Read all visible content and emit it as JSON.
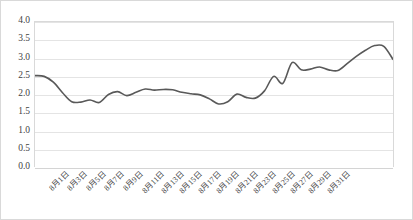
{
  "chart_data": {
    "type": "line",
    "title": "",
    "subtitle": "",
    "xlabel": "",
    "ylabel": "",
    "ylim": [
      0.0,
      4.0
    ],
    "y_ticks": [
      "0.0",
      "0.5",
      "1.0",
      "1.5",
      "2.0",
      "2.5",
      "3.0",
      "3.5",
      "4.0"
    ],
    "y_tick_values": [
      0.0,
      0.5,
      1.0,
      1.5,
      2.0,
      2.5,
      3.0,
      3.5,
      4.0
    ],
    "grid": true,
    "legend": false,
    "legend_position": "none",
    "line_color": "#595959",
    "line_width": 1.6,
    "x_tick_labels": [
      "8月1日",
      "8月3日",
      "8月5日",
      "8月7日",
      "8月9日",
      "8月11日",
      "8月13日",
      "8月15日",
      "8月17日",
      "8月19日",
      "8月21日",
      "8月23日",
      "8月25日",
      "8月27日",
      "8月29日",
      "8月31日"
    ],
    "x": [
      "8月1日",
      "8月2日",
      "8月3日",
      "8月4日",
      "8月5日",
      "8月6日",
      "8月7日",
      "8月8日",
      "8月9日",
      "8月10日",
      "8月11日",
      "8月12日",
      "8月13日",
      "8月14日",
      "8月15日",
      "8月16日",
      "8月17日",
      "8月18日",
      "8月19日",
      "8月20日",
      "8月21日",
      "8月22日",
      "8月23日",
      "8月24日",
      "8月25日",
      "8月26日",
      "8月27日",
      "8月28日",
      "8月29日",
      "8月30日",
      "8月31日"
    ],
    "values": [
      2.52,
      2.5,
      2.34,
      2.05,
      1.8,
      1.79,
      1.85,
      1.78,
      2.0,
      2.08,
      1.97,
      2.06,
      2.15,
      2.12,
      2.14,
      2.13,
      2.06,
      2.02,
      1.99,
      1.88,
      1.74,
      1.8,
      2.01,
      1.92,
      1.9,
      2.1,
      2.5,
      2.31,
      2.88,
      2.68,
      2.7
    ],
    "values_tail": [
      2.76,
      2.68,
      2.66,
      2.85,
      3.05,
      3.22,
      3.35,
      3.33,
      2.97
    ]
  }
}
